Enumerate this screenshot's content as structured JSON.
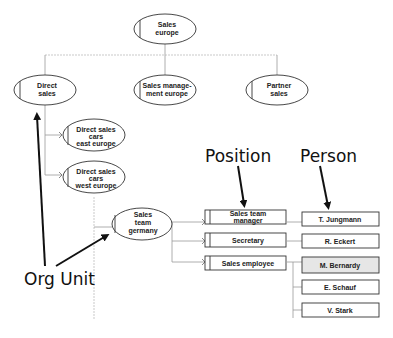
{
  "org_units": {
    "sales_europe": [
      "Sales",
      "europe"
    ],
    "direct_sales": [
      "Direct",
      "sales"
    ],
    "sales_management_europe": [
      "Sales manage-",
      "ment europe"
    ],
    "partner_sales": [
      "Partner",
      "sales"
    ],
    "direct_sales_cars_east": [
      "Direct sales",
      "cars",
      "east europe"
    ],
    "direct_sales_cars_west": [
      "Direct sales",
      "cars",
      "west europe"
    ],
    "sales_team_germany": [
      "Sales",
      "team",
      "germany"
    ]
  },
  "positions": {
    "sales_team_manager": [
      "Sales team",
      "manager"
    ],
    "secretary": [
      "Secretary"
    ],
    "sales_employee": [
      "Sales employee"
    ]
  },
  "persons": {
    "jungmann": "T. Jungmann",
    "eckert": "R. Eckert",
    "bernardy": "M. Bernardy",
    "schauf": "E. Schauf",
    "stark": "V. Stark"
  },
  "annotations": {
    "position": "Position",
    "person": "Person",
    "org_unit": "Org Unit"
  },
  "colors": {
    "highlight_fill": "#e6e6e6",
    "node_stroke": "#333333",
    "connector": "#999999"
  }
}
